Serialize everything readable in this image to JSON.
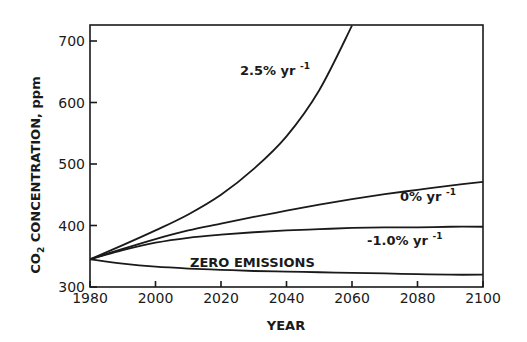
{
  "chart_data": {
    "type": "line",
    "title": "",
    "xlabel": "YEAR",
    "ylabel": "CO2 CONCENTRATION, ppm",
    "ylabel_parts": {
      "pre": "CO",
      "sub": "2",
      "post": " CONCENTRATION, ppm"
    },
    "xlim": [
      1980,
      2100
    ],
    "ylim": [
      300,
      725
    ],
    "xticks": [
      1980,
      2000,
      2020,
      2040,
      2060,
      2080,
      2100
    ],
    "yticks": [
      300,
      400,
      500,
      600,
      700
    ],
    "grid": false,
    "legend": "inline labels",
    "x": [
      1980,
      1990,
      2000,
      2010,
      2020,
      2030,
      2040,
      2050,
      2060,
      2070,
      2080,
      2090,
      2100
    ],
    "series": [
      {
        "name": "2.5% yr-1",
        "label_main": "2.5% yr",
        "label_sup": "-1",
        "values": [
          345,
          368,
          392,
          418,
          450,
          492,
          545,
          620,
          725,
          null,
          null,
          null,
          null
        ]
      },
      {
        "name": "0% yr-1",
        "label_main": "0% yr",
        "label_sup": "-1",
        "values": [
          345,
          362,
          378,
          392,
          403,
          414,
          424,
          434,
          443,
          451,
          458,
          465,
          471
        ]
      },
      {
        "name": "-1.0% yr-1",
        "label_main": "-1.0% yr",
        "label_sup": "-1",
        "values": [
          345,
          360,
          372,
          380,
          385,
          389,
          392,
          394,
          396,
          397,
          397,
          398,
          398
        ]
      },
      {
        "name": "ZERO EMISSIONS",
        "label_main": "ZERO EMISSIONS",
        "label_sup": "",
        "values": [
          345,
          338,
          333,
          330,
          328,
          326,
          325,
          324,
          323,
          322,
          321,
          320,
          320
        ]
      }
    ]
  }
}
